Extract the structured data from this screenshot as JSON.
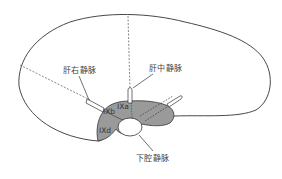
{
  "diagram": {
    "colors": {
      "outline": "#333333",
      "segment_fill": "#9a9a9a",
      "background": "#ffffff",
      "dashed_line": "#555555",
      "label_text": "#444444"
    },
    "labels": {
      "right_hepatic_vein": "肝右静脉",
      "middle_hepatic_vein": "肝中静脉",
      "inferior_vena_cava": "下腔静脉"
    },
    "segments": {
      "ixb": "IXb",
      "ixa": "IXa",
      "ixd": "IXd"
    }
  }
}
